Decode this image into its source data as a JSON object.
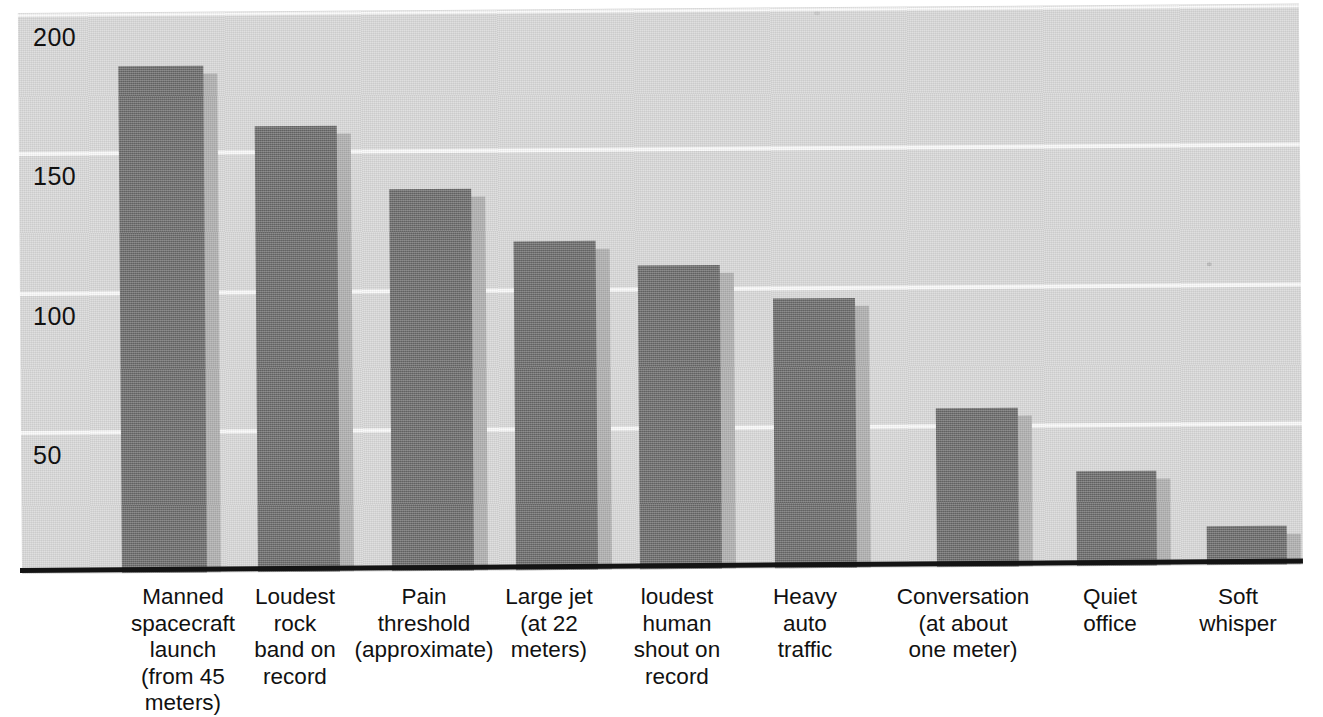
{
  "chart_data": {
    "type": "bar",
    "title": "",
    "xlabel": "",
    "ylabel": "",
    "ylim": [
      0,
      200
    ],
    "yticks": [
      50,
      100,
      150,
      200
    ],
    "ytick_labels": [
      "50",
      "100",
      "150",
      "200"
    ],
    "grid": true,
    "legend": null,
    "categories": [
      "Manned\nspacecraft\nlaunch\n(from 45\nmeters)",
      "Loudest\nrock\nband on\nrecord",
      "Pain\nthreshold\n(approximate)",
      "Large jet\n(at 22\nmeters)",
      "loudest\nhuman\nshout on\nrecord",
      "Heavy\nauto\ntraffic",
      "Conversation\n(at about\none meter)",
      "Quiet\noffice",
      "Soft\nwhisper"
    ],
    "values": [
      182,
      160,
      137,
      118,
      109,
      97,
      57,
      34,
      14
    ],
    "series": [
      {
        "name": "Sound level",
        "values": [
          182,
          160,
          137,
          118,
          109,
          97,
          57,
          34,
          14
        ]
      }
    ],
    "colors": {
      "bar": "#6e6e6e",
      "bar_shadow": "#b0b0b0",
      "plot_background": "#d9d9d9",
      "gridline": "#fbfbfb",
      "axis": "#141414",
      "text": "#111111",
      "page_background": "#ffffff"
    }
  },
  "geometry": {
    "plot": {
      "left": 22,
      "top": 13,
      "width": 1281,
      "height": 561
    },
    "baseline_y": 573,
    "px_per_unit": 2.785,
    "bars": [
      {
        "x": 100,
        "width": 85,
        "shadow_dx": 14
      },
      {
        "x": 236,
        "width": 82,
        "shadow_dx": 14
      },
      {
        "x": 370,
        "width": 82,
        "shadow_dx": 14
      },
      {
        "x": 494,
        "width": 82,
        "shadow_dx": 14
      },
      {
        "x": 618,
        "width": 82,
        "shadow_dx": 14
      },
      {
        "x": 753,
        "width": 82,
        "shadow_dx": 14
      },
      {
        "x": 915,
        "width": 82,
        "shadow_dx": 14
      },
      {
        "x": 1055,
        "width": 80,
        "shadow_dx": 14
      },
      {
        "x": 1185,
        "width": 80,
        "shadow_dx": 14
      }
    ],
    "label_centers": [
      183,
      295,
      424,
      549,
      677,
      805,
      963,
      1110,
      1238
    ],
    "label_widths": [
      190,
      150,
      210,
      160,
      160,
      140,
      220,
      150,
      150
    ]
  }
}
